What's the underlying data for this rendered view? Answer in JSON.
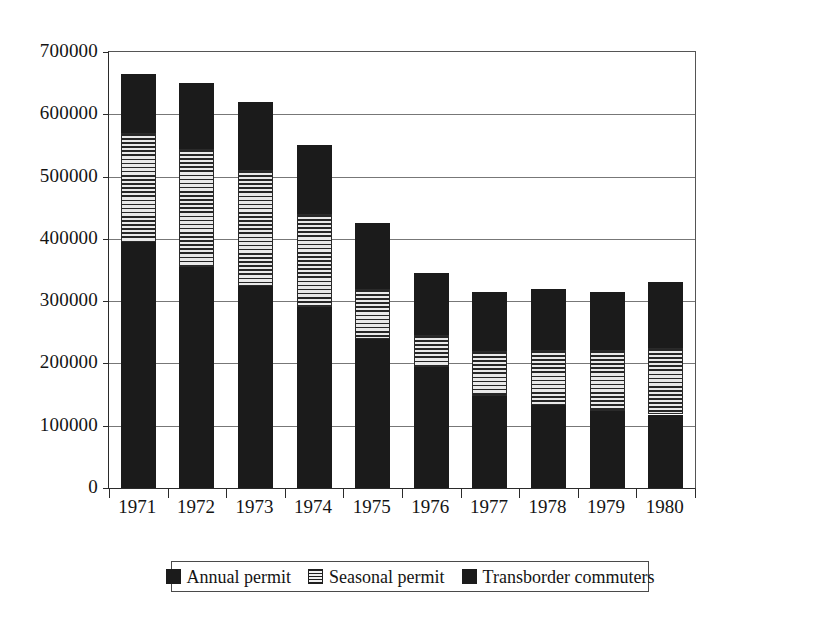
{
  "chart_data": {
    "type": "bar",
    "stacked": true,
    "title": "",
    "subtitle": "",
    "xlabel": "",
    "ylabel": "",
    "categories": [
      "1971",
      "1972",
      "1973",
      "1974",
      "1975",
      "1976",
      "1977",
      "1978",
      "1979",
      "1980"
    ],
    "ylim": [
      0,
      700000
    ],
    "ytick_labels": [
      "0",
      "100000",
      "200000",
      "300000",
      "400000",
      "500000",
      "600000",
      "700000"
    ],
    "ytick_values": [
      0,
      100000,
      200000,
      300000,
      400000,
      500000,
      600000,
      700000
    ],
    "grid": true,
    "legend_position": "bottom",
    "series": [
      {
        "name": "Transborder commuters",
        "fill": "solid-dark",
        "color": "#1b1b1b",
        "stack_order": 1,
        "values": [
          395000,
          355000,
          325000,
          290000,
          240000,
          195000,
          148000,
          133000,
          123000,
          118000
        ]
      },
      {
        "name": "Seasonal permit",
        "fill": "horizontal-stripes",
        "color": "#e9e9e9",
        "stack_order": 2,
        "values": [
          175000,
          190000,
          185000,
          150000,
          80000,
          50000,
          72000,
          89000,
          99000,
          107000
        ]
      },
      {
        "name": "Annual permit",
        "fill": "solid-dark",
        "color": "#1b1b1b",
        "stack_order": 3,
        "values": [
          95000,
          105000,
          110000,
          110000,
          105000,
          100000,
          95000,
          98000,
          93000,
          105000
        ]
      }
    ],
    "totals": [
      665000,
      650000,
      620000,
      550000,
      425000,
      345000,
      315000,
      320000,
      315000,
      330000
    ]
  },
  "legend": {
    "entries": [
      {
        "label": "Annual permit",
        "swatch": "solid-dark-swatch"
      },
      {
        "label": "Seasonal permit",
        "swatch": "striped-swatch"
      },
      {
        "label": "Transborder commuters",
        "swatch": "solid-dark-swatch"
      }
    ]
  }
}
